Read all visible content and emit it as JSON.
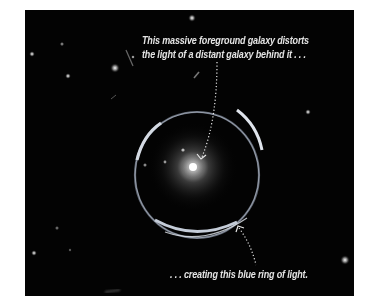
{
  "figure": {
    "caption_top": {
      "line1": "This massive foreground galaxy  distorts",
      "line2": "the light of a distant galaxy behind it . . ."
    },
    "caption_bottom": ". . . creating this blue ring of light.",
    "colors": {
      "background": "#030303",
      "text": "#e4e4e4",
      "ring": "#bcc8d8",
      "galaxy_core": "#ffffff"
    }
  }
}
